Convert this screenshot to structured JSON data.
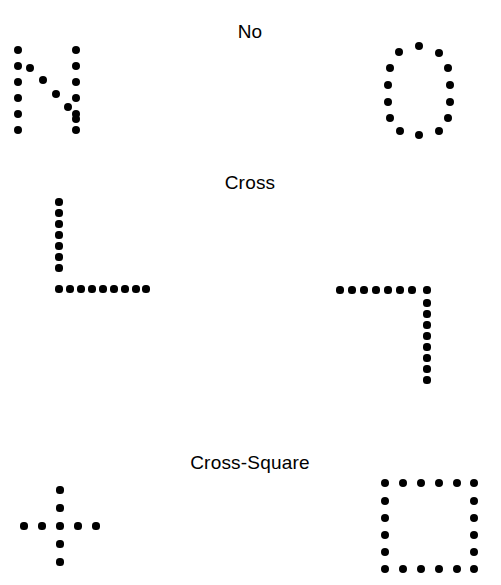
{
  "page": {
    "width": 501,
    "height": 585,
    "background": "#ffffff",
    "ink_color": "#000000"
  },
  "rows": [
    {
      "id": "row-no",
      "label": "No",
      "label_x": 250,
      "label_y": 21,
      "left_figure": "letter-N-dots",
      "right_figure": "letter-O-dots"
    },
    {
      "id": "row-cross",
      "label": "Cross",
      "label_x": 250,
      "label_y": 172,
      "left_figure": "corner-L-dots",
      "right_figure": "corner-reverse-L-dots"
    },
    {
      "id": "row-cross-square",
      "label": "Cross-Square",
      "label_x": 250,
      "label_y": 452,
      "left_figure": "plus-cross-dots",
      "right_figure": "square-outline-dots"
    }
  ],
  "figures": {
    "letter_n": {
      "name": "letter-N-dots",
      "dot_radius": 4.2,
      "dots": [
        [
          18,
          50
        ],
        [
          18,
          66
        ],
        [
          18,
          82
        ],
        [
          18,
          98
        ],
        [
          18,
          114
        ],
        [
          18,
          130
        ],
        [
          30,
          68
        ],
        [
          43,
          80
        ],
        [
          56,
          94
        ],
        [
          68,
          107
        ],
        [
          76,
          119
        ],
        [
          76,
          50
        ],
        [
          76,
          66
        ],
        [
          76,
          82
        ],
        [
          76,
          98
        ],
        [
          76,
          114
        ],
        [
          76,
          130
        ]
      ]
    },
    "letter_o": {
      "name": "letter-O-dots",
      "dot_radius": 4.2,
      "dots": [
        [
          419,
          46
        ],
        [
          399,
          52
        ],
        [
          439,
          53
        ],
        [
          390,
          68
        ],
        [
          448,
          68
        ],
        [
          388,
          85
        ],
        [
          450,
          85
        ],
        [
          388,
          102
        ],
        [
          450,
          102
        ],
        [
          390,
          118
        ],
        [
          448,
          118
        ],
        [
          400,
          131
        ],
        [
          439,
          131
        ],
        [
          419,
          135
        ]
      ]
    },
    "corner_l": {
      "name": "corner-L-dots",
      "dot_radius": 3.6,
      "dots": [
        [
          59,
          202
        ],
        [
          59,
          213
        ],
        [
          59,
          224
        ],
        [
          59,
          235
        ],
        [
          59,
          246
        ],
        [
          59,
          257
        ],
        [
          59,
          268
        ],
        [
          59,
          289
        ],
        [
          70,
          289
        ],
        [
          81,
          289
        ],
        [
          92,
          289
        ],
        [
          103,
          289
        ],
        [
          114,
          289
        ],
        [
          125,
          289
        ],
        [
          136,
          289
        ],
        [
          146,
          289
        ]
      ]
    },
    "corner_reverse_l": {
      "name": "corner-reverse-L-dots",
      "dot_radius": 3.6,
      "dots": [
        [
          340,
          290
        ],
        [
          352,
          290
        ],
        [
          364,
          290
        ],
        [
          376,
          290
        ],
        [
          388,
          290
        ],
        [
          400,
          290
        ],
        [
          412,
          290
        ],
        [
          427,
          290
        ],
        [
          427,
          303
        ],
        [
          427,
          314
        ],
        [
          427,
          325
        ],
        [
          427,
          336
        ],
        [
          427,
          347
        ],
        [
          427,
          358
        ],
        [
          427,
          369
        ],
        [
          427,
          380
        ]
      ]
    },
    "plus_cross": {
      "name": "plus-cross-dots",
      "dot_radius": 3.6,
      "dots": [
        [
          60,
          490
        ],
        [
          60,
          508
        ],
        [
          60,
          526
        ],
        [
          60,
          544
        ],
        [
          60,
          562
        ],
        [
          24,
          526
        ],
        [
          42,
          526
        ],
        [
          78,
          526
        ],
        [
          96,
          526
        ]
      ]
    },
    "square_outline": {
      "name": "square-outline-dots",
      "dot_radius": 4.0,
      "dots": [
        [
          385,
          483
        ],
        [
          403,
          483
        ],
        [
          421,
          483
        ],
        [
          439,
          483
        ],
        [
          457,
          483
        ],
        [
          474,
          483
        ],
        [
          385,
          501
        ],
        [
          474,
          501
        ],
        [
          385,
          518
        ],
        [
          474,
          518
        ],
        [
          385,
          535
        ],
        [
          474,
          535
        ],
        [
          385,
          552
        ],
        [
          474,
          552
        ],
        [
          385,
          569
        ],
        [
          403,
          569
        ],
        [
          421,
          569
        ],
        [
          439,
          569
        ],
        [
          457,
          569
        ],
        [
          474,
          569
        ]
      ]
    }
  }
}
